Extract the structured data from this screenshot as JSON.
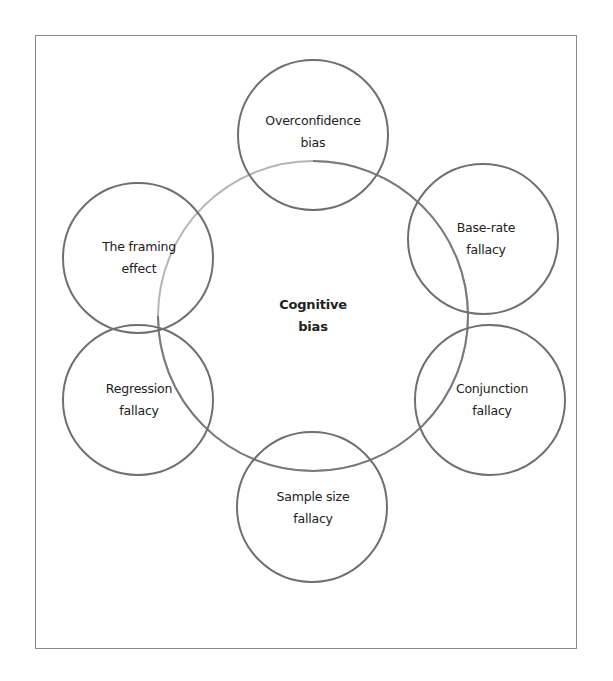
{
  "diagram": {
    "center": {
      "line1": "Cognitive",
      "line2": "bias"
    },
    "satellites": [
      {
        "id": "overconfidence",
        "line1": "Overconfidence",
        "line2": "bias"
      },
      {
        "id": "base-rate",
        "line1": "Base-rate",
        "line2": "fallacy"
      },
      {
        "id": "conjunction",
        "line1": "Conjunction",
        "line2": "fallacy"
      },
      {
        "id": "sample-size",
        "line1": "Sample size",
        "line2": "fallacy"
      },
      {
        "id": "regression",
        "line1": "Regression",
        "line2": "fallacy"
      },
      {
        "id": "framing",
        "line1": "The framing",
        "line2": "effect"
      }
    ],
    "colors": {
      "stroke": "#6f6f6f",
      "stroke_light": "#b0b0b0",
      "frame": "#8a8a8a",
      "text": "#222222"
    }
  }
}
